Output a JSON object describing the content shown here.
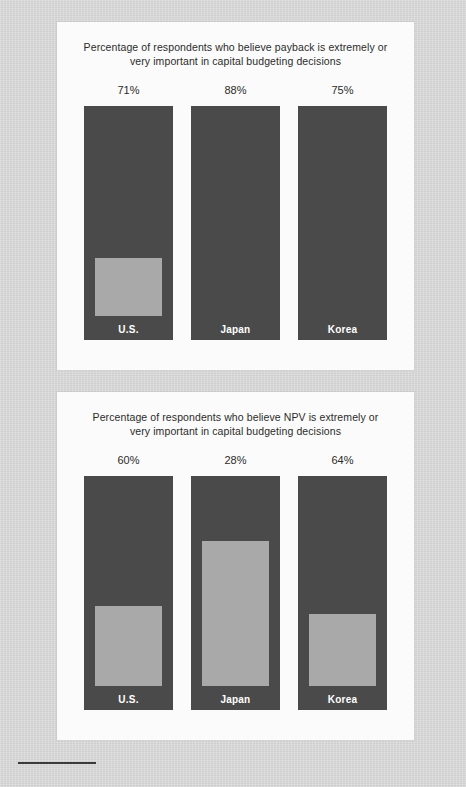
{
  "charts": [
    {
      "title": "Percentage of respondents who believe payback is extremely or very important in capital budgeting decisions",
      "chart_data": {
        "type": "bar",
        "title": "Percentage of respondents who believe payback is extremely or very important in capital budgeting decisions",
        "categories": [
          "U.S.",
          "Japan",
          "Korea"
        ],
        "values": [
          71,
          88,
          75
        ],
        "value_labels": [
          "71%",
          "88%",
          "75%"
        ],
        "xlabel": "",
        "ylabel": "",
        "ylim": [
          0,
          100
        ],
        "grid": false,
        "legend": "none",
        "bar_color": "#4a4a4a",
        "fill_color": "#a9a9a9"
      }
    },
    {
      "title": "Percentage of respondents who believe NPV is extremely or very important in capital budgeting decisions",
      "chart_data": {
        "type": "bar",
        "title": "Percentage of respondents who believe NPV is extremely or very important in capital budgeting decisions",
        "categories": [
          "U.S.",
          "Japan",
          "Korea"
        ],
        "values": [
          60,
          28,
          64
        ],
        "value_labels": [
          "60%",
          "28%",
          "64%"
        ],
        "xlabel": "",
        "ylabel": "",
        "ylim": [
          0,
          100
        ],
        "grid": false,
        "legend": "none",
        "bar_color": "#4a4a4a",
        "fill_color": "#a9a9a9"
      }
    }
  ]
}
